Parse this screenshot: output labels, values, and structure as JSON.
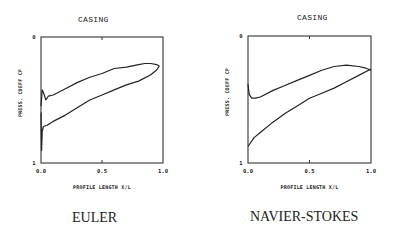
{
  "panels": [
    {
      "title": "CASING",
      "caption": "EULER",
      "ylabel": "PRESS. COEFF CP",
      "xlabel": "PROFILE LENGTH X/L",
      "y_ticks": [
        "0",
        "1"
      ],
      "x_ticks": [
        "0.0",
        "0.5",
        "1.0"
      ]
    },
    {
      "title": "CASING",
      "caption": "NAVIER-STOKES",
      "ylabel": "PRESS. COEFF CP",
      "xlabel": "PROFILE LENGTH X/L",
      "y_ticks": [
        "0",
        "1"
      ],
      "x_ticks": [
        "0.0",
        "0.5",
        "1.0"
      ]
    }
  ],
  "chart_data": [
    {
      "type": "line",
      "title": "CASING",
      "caption": "EULER",
      "xlabel": "PROFILE LENGTH X/L",
      "ylabel": "PRESS. COEFF CP",
      "xlim": [
        0,
        1.0
      ],
      "ylim": [
        0,
        1
      ],
      "y_inverted": true,
      "x_ticks": [
        0.0,
        0.5,
        1.0
      ],
      "y_ticks": [
        0,
        1
      ],
      "grid": false,
      "series": [
        {
          "name": "upper",
          "x": [
            0.0,
            0.01,
            0.02,
            0.04,
            0.06,
            0.1,
            0.2,
            0.3,
            0.4,
            0.5,
            0.6,
            0.7,
            0.8,
            0.85,
            0.9,
            0.95,
            0.97
          ],
          "y": [
            0.55,
            0.42,
            0.44,
            0.5,
            0.47,
            0.46,
            0.41,
            0.36,
            0.32,
            0.29,
            0.25,
            0.24,
            0.22,
            0.21,
            0.21,
            0.22,
            0.23
          ]
        },
        {
          "name": "lower",
          "x": [
            0.0,
            0.005,
            0.01,
            0.02,
            0.05,
            0.1,
            0.2,
            0.3,
            0.4,
            0.5,
            0.6,
            0.7,
            0.8,
            0.9,
            0.95,
            0.97
          ],
          "y": [
            0.6,
            0.9,
            0.75,
            0.71,
            0.7,
            0.67,
            0.62,
            0.56,
            0.5,
            0.46,
            0.42,
            0.38,
            0.35,
            0.3,
            0.26,
            0.23
          ]
        }
      ]
    },
    {
      "type": "line",
      "title": "CASING",
      "caption": "NAVIER-STOKES",
      "xlabel": "PROFILE LENGTH X/L",
      "ylabel": "PRESS. COEFF CP",
      "xlim": [
        0,
        1.0
      ],
      "ylim": [
        0,
        1
      ],
      "y_inverted": true,
      "x_ticks": [
        0.0,
        0.5,
        1.0
      ],
      "y_ticks": [
        0,
        1
      ],
      "grid": false,
      "series": [
        {
          "name": "upper",
          "x": [
            0.0,
            0.01,
            0.03,
            0.06,
            0.1,
            0.2,
            0.3,
            0.4,
            0.5,
            0.6,
            0.7,
            0.8,
            0.9,
            0.95,
            1.0
          ],
          "y": [
            0.38,
            0.46,
            0.49,
            0.49,
            0.48,
            0.43,
            0.39,
            0.35,
            0.31,
            0.27,
            0.24,
            0.23,
            0.24,
            0.25,
            0.27
          ]
        },
        {
          "name": "lower",
          "x": [
            0.0,
            0.05,
            0.1,
            0.2,
            0.3,
            0.4,
            0.5,
            0.6,
            0.7,
            0.8,
            0.9,
            1.0
          ],
          "y": [
            0.87,
            0.8,
            0.76,
            0.68,
            0.61,
            0.55,
            0.49,
            0.45,
            0.41,
            0.36,
            0.31,
            0.26
          ]
        }
      ]
    }
  ]
}
